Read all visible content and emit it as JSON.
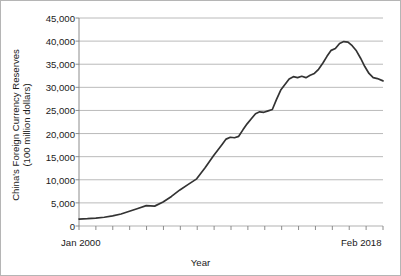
{
  "chart_data": {
    "type": "line",
    "title": "",
    "xlabel": "Year",
    "ylabel": "China's Foreign Currency Reserves",
    "ylabel_line2": "(100 million dollars)",
    "ylabel_lines": [
      "China's Foreign Currency Reserves",
      "(100 million dollars)"
    ],
    "ylim": [
      0,
      45000
    ],
    "ytick_labels": [
      "45,000",
      "40,000",
      "35,000",
      "30,000",
      "25,000",
      "20,000",
      "15,000",
      "10,000",
      "5,000",
      "0"
    ],
    "ytick_values": [
      45000,
      40000,
      35000,
      30000,
      25000,
      20000,
      15000,
      10000,
      5000,
      0
    ],
    "xlim_labels": [
      "Jan 2000",
      "Feb 2018"
    ],
    "x_start_label": "Jan 2000",
    "x_end_label": "Feb 2018",
    "x_tick_count": 19,
    "grid": "horizontal",
    "legend": "none",
    "line_color": "#333333",
    "grid_color": "#a8a8a8",
    "axis_color": "#808080",
    "series": [
      {
        "name": "China's Foreign Currency Reserves",
        "x": [
          2000.0,
          2000.5,
          2001.0,
          2001.5,
          2002.0,
          2002.5,
          2003.0,
          2003.5,
          2004.0,
          2004.5,
          2005.0,
          2005.5,
          2006.0,
          2006.5,
          2007.0,
          2007.25,
          2007.5,
          2007.75,
          2008.0,
          2008.25,
          2008.5,
          2008.75,
          2009.0,
          2009.25,
          2009.5,
          2009.75,
          2010.0,
          2010.25,
          2010.5,
          2010.75,
          2011.0,
          2011.25,
          2011.5,
          2011.75,
          2012.0,
          2012.25,
          2012.5,
          2012.75,
          2013.0,
          2013.25,
          2013.5,
          2013.75,
          2014.0,
          2014.25,
          2014.5,
          2014.75,
          2015.0,
          2015.25,
          2015.5,
          2015.75,
          2016.0,
          2016.25,
          2016.5,
          2016.75,
          2017.0,
          2017.25,
          2017.5,
          2017.75,
          2018.083
        ],
        "values": [
          1500,
          1580,
          1700,
          1900,
          2200,
          2600,
          3200,
          3800,
          4400,
          4300,
          5200,
          6400,
          7800,
          9000,
          10200,
          11400,
          12600,
          13900,
          15200,
          16400,
          17600,
          18800,
          19200,
          19100,
          19400,
          20800,
          22100,
          23200,
          24300,
          24700,
          24600,
          24900,
          25200,
          27400,
          29400,
          30600,
          31800,
          32300,
          32100,
          32400,
          32100,
          32600,
          33000,
          33900,
          35200,
          36700,
          38000,
          38400,
          39500,
          39900,
          39800,
          39000,
          37900,
          36300,
          34500,
          33000,
          32100,
          31900,
          31400
        ]
      }
    ],
    "annotations": {
      "peak_value": 39900,
      "start_value": 1500,
      "end_value": 31400
    }
  }
}
